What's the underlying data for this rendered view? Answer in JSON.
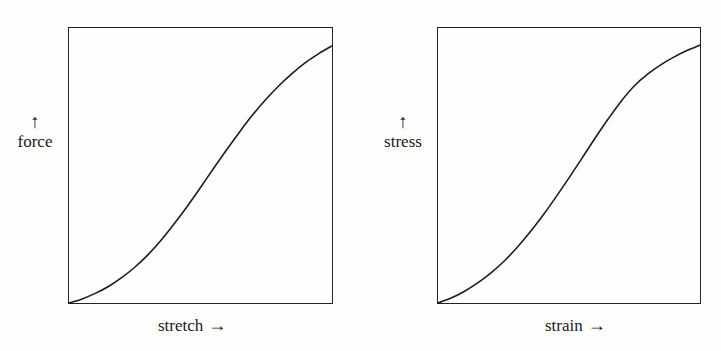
{
  "figure": {
    "background_color": "#fdfdfc",
    "ink_color": "#1d1d1d"
  },
  "panels": [
    {
      "id": "force-stretch",
      "y_axis": {
        "arrow": "↑",
        "label": "force"
      },
      "x_axis": {
        "label": "stretch",
        "arrow": "→"
      }
    },
    {
      "id": "stress-strain",
      "y_axis": {
        "arrow": "↑",
        "label": "stress"
      },
      "x_axis": {
        "label": "strain",
        "arrow": "→"
      }
    }
  ],
  "chart_data": [
    {
      "type": "line",
      "title": "",
      "xlabel": "stretch →",
      "ylabel": "force ↑",
      "xlim": [
        0,
        1
      ],
      "ylim": [
        0,
        1
      ],
      "grid": false,
      "legend": null,
      "axis_ticks": {
        "x": [],
        "y": []
      },
      "series": [
        {
          "name": "force vs stretch",
          "x": [
            0.0,
            0.05,
            0.1,
            0.15,
            0.2,
            0.25,
            0.3,
            0.35,
            0.4,
            0.45,
            0.5,
            0.55,
            0.6,
            0.65,
            0.7,
            0.75,
            0.8,
            0.85,
            0.9,
            0.95,
            1.0
          ],
          "y": [
            0.0,
            0.015,
            0.035,
            0.06,
            0.092,
            0.13,
            0.175,
            0.228,
            0.288,
            0.352,
            0.42,
            0.49,
            0.558,
            0.624,
            0.686,
            0.742,
            0.792,
            0.836,
            0.875,
            0.907,
            0.935
          ]
        }
      ],
      "annotations": [
        {
          "text": "sigmoid / J-shaped curve starting at origin, concave up then concave down"
        }
      ]
    },
    {
      "type": "line",
      "title": "",
      "xlabel": "strain →",
      "ylabel": "stress ↑",
      "xlim": [
        0,
        1
      ],
      "ylim": [
        0,
        1
      ],
      "grid": false,
      "legend": null,
      "axis_ticks": {
        "x": [],
        "y": []
      },
      "series": [
        {
          "name": "stress vs strain",
          "x": [
            0.0,
            0.05,
            0.1,
            0.15,
            0.2,
            0.25,
            0.3,
            0.35,
            0.4,
            0.45,
            0.5,
            0.55,
            0.6,
            0.65,
            0.7,
            0.75,
            0.8,
            0.85,
            0.9,
            0.95,
            1.0
          ],
          "y": [
            0.0,
            0.018,
            0.042,
            0.072,
            0.108,
            0.15,
            0.2,
            0.256,
            0.318,
            0.385,
            0.455,
            0.527,
            0.6,
            0.67,
            0.735,
            0.79,
            0.832,
            0.866,
            0.894,
            0.918,
            0.938
          ]
        }
      ],
      "annotations": [
        {
          "text": "sigmoid curve with sharper knee near upper right"
        }
      ]
    }
  ]
}
